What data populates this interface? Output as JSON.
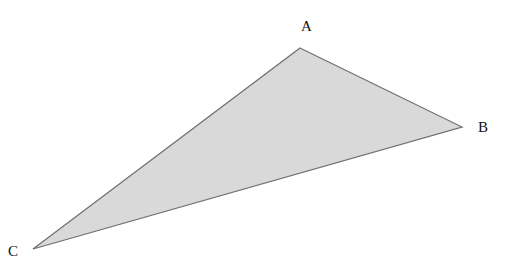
{
  "diagram": {
    "type": "triangle",
    "fill_color": "#d9d9d9",
    "stroke_color": "#6f6f6f",
    "vertices": [
      {
        "name": "A",
        "x": 300,
        "y": 48
      },
      {
        "name": "B",
        "x": 462,
        "y": 127
      },
      {
        "name": "C",
        "x": 33,
        "y": 249
      }
    ],
    "labels": {
      "A": {
        "text": "A",
        "x": 301,
        "y": 31
      },
      "B": {
        "text": "B",
        "x": 478,
        "y": 132
      },
      "C": {
        "text": "C",
        "x": 8,
        "y": 256
      }
    }
  }
}
